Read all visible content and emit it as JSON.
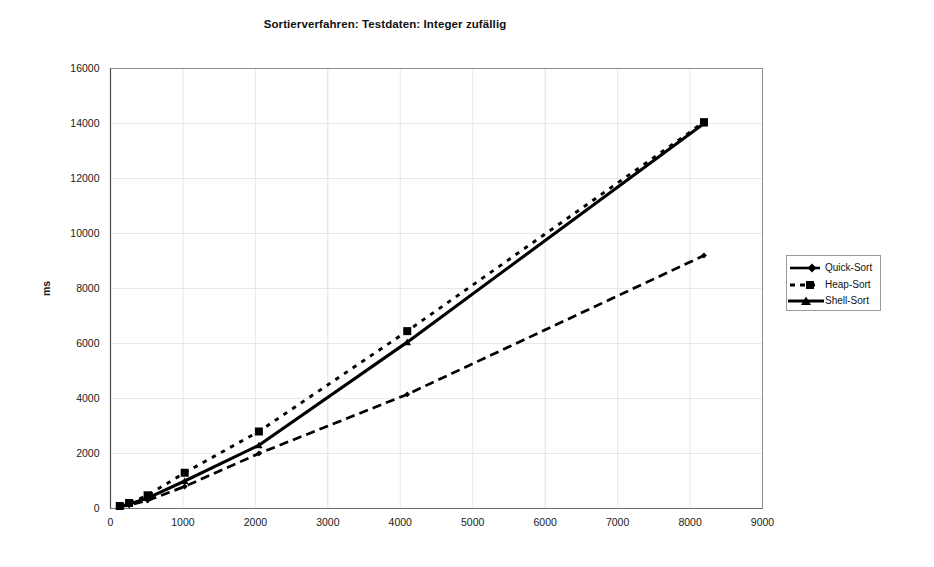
{
  "chart_data": {
    "type": "line",
    "title": "Sortierverfahren: Testdaten: Integer zufällig",
    "xlabel": "",
    "ylabel": "ms",
    "xlim": [
      0,
      9000
    ],
    "ylim": [
      0,
      16000
    ],
    "xticks": [
      "0",
      "1000",
      "2000",
      "3000",
      "4000",
      "5000",
      "6000",
      "7000",
      "8000",
      "9000"
    ],
    "yticks": [
      "0",
      "2000",
      "4000",
      "6000",
      "8000",
      "10000",
      "12000",
      "14000",
      "16000"
    ],
    "grid": true,
    "legend_position": "right",
    "x": [
      128,
      256,
      512,
      1024,
      2048,
      4096,
      8192
    ],
    "series": [
      {
        "name": "Quick-Sort",
        "marker": "diamond",
        "dash": "dashdot",
        "values": [
          60,
          120,
          290,
          800,
          2000,
          4150,
          9200
        ]
      },
      {
        "name": "Heap-Sort",
        "marker": "square",
        "dash": "dotted",
        "values": [
          90,
          200,
          480,
          1300,
          2800,
          6450,
          14050
        ]
      },
      {
        "name": "Shell-Sort",
        "marker": "triangle",
        "dash": "solid",
        "values": [
          70,
          160,
          380,
          1000,
          2300,
          6050,
          14000
        ]
      }
    ]
  },
  "axes": {
    "y_axis_title": "ms"
  },
  "legend": {
    "entries": [
      {
        "label": "Quick-Sort"
      },
      {
        "label": "Heap-Sort"
      },
      {
        "label": "Shell-Sort"
      }
    ]
  },
  "colors": {
    "series": "#000000",
    "frame": "#8c8c8c",
    "grid": "#d9d9d9",
    "text": "#111111"
  }
}
